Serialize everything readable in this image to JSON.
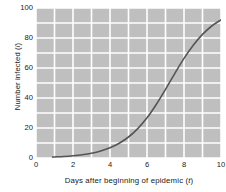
{
  "chart": {
    "type": "line",
    "title": "",
    "xlabel_text": "Days after beginning of epidemic (",
    "xlabel_var": "t",
    "xlabel_close": ")",
    "ylabel_text": "Number infected (",
    "ylabel_var": "i",
    "ylabel_close": ")",
    "plot_background": "#bfbfbf",
    "grid_color": "#ffffff",
    "line_color": "#555555",
    "text_color": "#1a1a1a"
  },
  "chart_data": {
    "type": "line",
    "title": "",
    "xlabel": "Days after beginning of epidemic (t)",
    "ylabel": "Number infected (i)",
    "xlim": [
      0,
      10
    ],
    "ylim": [
      0,
      100
    ],
    "xticks": [
      0,
      2,
      4,
      6,
      8,
      10
    ],
    "yticks": [
      0,
      20,
      40,
      60,
      80,
      100
    ],
    "xtick_labels": [
      "0",
      "2",
      "4",
      "6",
      "8",
      "10"
    ],
    "ytick_labels": [
      "0",
      "20",
      "40",
      "60",
      "80",
      "100"
    ],
    "grid": true,
    "grid_minor_x_step": 1,
    "grid_minor_y_step": 10,
    "legend": null,
    "series": [
      {
        "name": "infected",
        "x": [
          0.9,
          1.0,
          1.5,
          2.0,
          2.5,
          3.0,
          3.5,
          4.0,
          4.5,
          5.0,
          5.5,
          6.0,
          6.5,
          7.0,
          7.5,
          8.0,
          8.5,
          9.0,
          9.5,
          10.0
        ],
        "values": [
          0.6,
          0.7,
          1.0,
          1.5,
          2.2,
          3.2,
          4.7,
          6.8,
          9.8,
          14.0,
          19.6,
          26.8,
          35.7,
          45.8,
          56.3,
          66.4,
          75.2,
          82.4,
          88.0,
          92.1
        ]
      }
    ]
  },
  "axis": {
    "yticks": [
      {
        "label": "100",
        "value": 100
      },
      {
        "label": "80",
        "value": 80
      },
      {
        "label": "60",
        "value": 60
      },
      {
        "label": "40",
        "value": 40
      },
      {
        "label": "20",
        "value": 20
      },
      {
        "label": "0",
        "value": 0
      }
    ],
    "xticks": [
      {
        "label": "0",
        "value": 0
      },
      {
        "label": "2",
        "value": 2
      },
      {
        "label": "4",
        "value": 4
      },
      {
        "label": "6",
        "value": 6
      },
      {
        "label": "8",
        "value": 8
      },
      {
        "label": "10",
        "value": 10
      }
    ]
  }
}
